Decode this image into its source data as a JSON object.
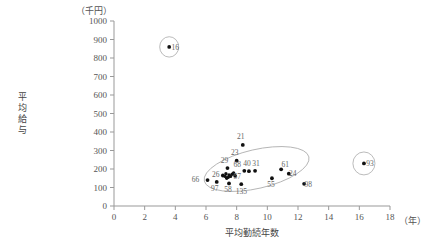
{
  "chart_data": {
    "type": "scatter",
    "title": "",
    "xlabel": "平均勤続年数",
    "ylabel": "平均給与",
    "x_unit": "（年）",
    "y_unit": "（千円）",
    "xlim": [
      0,
      18
    ],
    "ylim": [
      0,
      1000
    ],
    "xticks": [
      "0",
      "2",
      "4",
      "6",
      "8",
      "10",
      "12",
      "14",
      "16",
      "18"
    ],
    "yticks": [
      "0",
      "100",
      "200",
      "300",
      "400",
      "500",
      "600",
      "700",
      "800",
      "900",
      "1000"
    ],
    "grid": false,
    "legend": "none",
    "points": [
      {
        "label": "16",
        "x": 3.6,
        "y": 860,
        "label_dx": 6,
        "label_dy": 3
      },
      {
        "label": "21",
        "x": 8.4,
        "y": 330,
        "label_dx": -2,
        "label_dy": -6
      },
      {
        "label": "23",
        "x": 8.0,
        "y": 245,
        "label_dx": -2,
        "label_dy": -6
      },
      {
        "label": "29",
        "x": 7.4,
        "y": 205,
        "label_dx": -3,
        "label_dy": -5
      },
      {
        "label": "68",
        "x": 8.5,
        "y": 190,
        "label_dx": -7,
        "label_dy": -4
      },
      {
        "label": "40",
        "x": 8.8,
        "y": 188,
        "label_dx": -2,
        "label_dy": -5
      },
      {
        "label": "31",
        "x": 9.2,
        "y": 190,
        "label_dx": 1,
        "label_dy": -5
      },
      {
        "label": "61",
        "x": 10.9,
        "y": 198,
        "label_dx": 4,
        "label_dy": -2
      },
      {
        "label": "24",
        "x": 11.4,
        "y": 175,
        "label_dx": 4,
        "label_dy": 2
      },
      {
        "label": "26",
        "x": 7.1,
        "y": 165,
        "label_dx": -7,
        "label_dy": 2
      },
      {
        "label": "57",
        "x": 7.9,
        "y": 163,
        "label_dx": 2,
        "label_dy": 3
      },
      {
        "label": "55",
        "x": 10.3,
        "y": 150,
        "label_dx": -1,
        "label_dy": 9
      },
      {
        "label": "66",
        "x": 6.1,
        "y": 140,
        "label_dx": -12,
        "label_dy": 2
      },
      {
        "label": "97",
        "x": 6.7,
        "y": 130,
        "label_dx": -2,
        "label_dy": 9
      },
      {
        "label": "58",
        "x": 7.5,
        "y": 122,
        "label_dx": -1,
        "label_dy": 9
      },
      {
        "label": "135",
        "x": 8.3,
        "y": 118,
        "label_dx": 0,
        "label_dy": 10
      },
      {
        "label": "98",
        "x": 12.4,
        "y": 120,
        "label_dx": 4,
        "label_dy": 3
      },
      {
        "label": "93",
        "x": 16.3,
        "y": 230,
        "label_dx": 6,
        "label_dy": 3
      }
    ],
    "extra_points": [
      {
        "x": 7.3,
        "y": 175
      },
      {
        "x": 7.5,
        "y": 168
      },
      {
        "x": 7.6,
        "y": 160
      },
      {
        "x": 7.45,
        "y": 155
      },
      {
        "x": 7.7,
        "y": 172
      },
      {
        "x": 7.35,
        "y": 150
      },
      {
        "x": 7.8,
        "y": 178
      },
      {
        "x": 7.25,
        "y": 160
      }
    ],
    "annotations": [
      {
        "name": "main-cluster-ellipse",
        "cx": 9.3,
        "cy": 200,
        "rx": 3.5,
        "ry": 1.05,
        "rotate": -13
      },
      {
        "name": "outlier-circle-16",
        "cx": 3.6,
        "cy": 860,
        "rx": 0.62,
        "ry": 0.55,
        "rotate": 0
      },
      {
        "name": "outlier-circle-93",
        "cx": 16.3,
        "cy": 230,
        "rx": 0.72,
        "ry": 0.62,
        "rotate": 0
      }
    ]
  }
}
